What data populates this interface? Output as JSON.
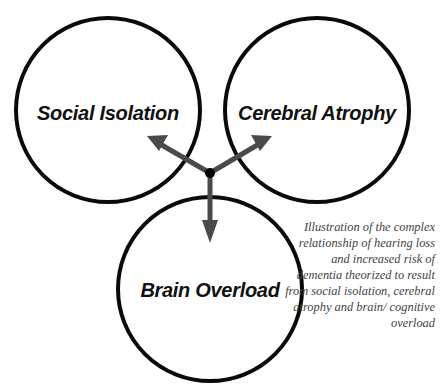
{
  "diagram": {
    "nodes": [
      {
        "id": "social",
        "label": "Social Isolation",
        "cx": 108,
        "cy": 110,
        "r": 92
      },
      {
        "id": "cerebral",
        "label": "Cerebral Atrophy",
        "cx": 317,
        "cy": 110,
        "r": 92
      },
      {
        "id": "brain",
        "label": "Brain Overload",
        "cx": 210,
        "cy": 289,
        "r": 92
      }
    ],
    "hub": {
      "x": 210,
      "y": 173
    },
    "arrows": [
      {
        "to": "social",
        "tip": [
          147,
          136
        ]
      },
      {
        "to": "cerebral",
        "tip": [
          272,
          136
        ]
      },
      {
        "to": "brain",
        "tip": [
          210,
          243
        ]
      }
    ],
    "colors": {
      "circle": "#0a0a0a",
      "arrow": "#4a4a4a",
      "hub": "#000000"
    }
  },
  "caption": "Illustration of the complex relationship of hearing loss and increased risk of dementia theorized to result from social isolation, cerebral atrophy and brain/ cognitive overload"
}
